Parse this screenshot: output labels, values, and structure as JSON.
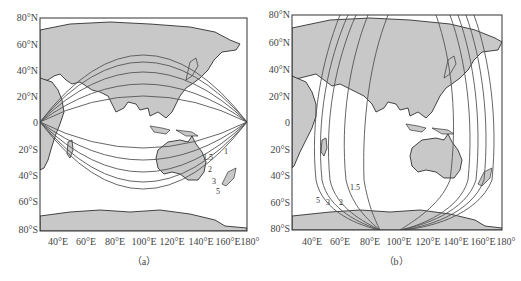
{
  "figure": {
    "panels": [
      {
        "id": "a",
        "caption": "（a）",
        "y_ticks": [
          "80°N",
          "60°N",
          "40°N",
          "20°N",
          "0",
          "20°S",
          "40°S",
          "60°S",
          "80°S"
        ],
        "x_ticks": [
          "40°E",
          "60°E",
          "80°E",
          "100°E",
          "120°E",
          "140°E",
          "160°E",
          "180°"
        ],
        "contour_labels": [
          "1",
          "1.5",
          "2",
          "3",
          "5"
        ],
        "description": "Contours arcing from western edge (0°, ~25°E) to eastern edge (0°, 180°)"
      },
      {
        "id": "b",
        "caption": "（b）",
        "y_ticks": [
          "80°N",
          "60°N",
          "40°N",
          "20°N",
          "0",
          "20°S",
          "40°S",
          "60°S",
          "80°S"
        ],
        "x_ticks": [
          "40°E",
          "60°E",
          "80°E",
          "100°E",
          "120°E",
          "140°E",
          "160°E",
          "180°"
        ],
        "contour_labels": [
          "5",
          "3",
          "2",
          "1.5"
        ],
        "description": "Contours running nearly meridionally, converging near 80°S between 100°E and 120°E"
      }
    ],
    "colors": {
      "land": "#c8c8c8",
      "coast": "#1a1a1a",
      "contour": "#555555",
      "frame": "#333333",
      "ocean": "#ffffff"
    }
  }
}
